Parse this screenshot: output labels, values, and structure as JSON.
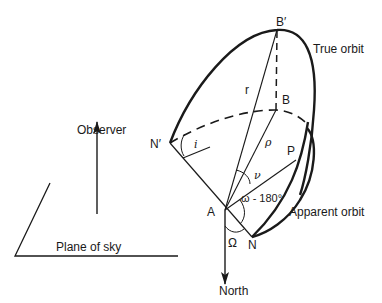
{
  "diagram": {
    "type": "orbital-geometry",
    "labels": {
      "b_prime": "B′",
      "b": "B",
      "true_orbit": "True orbit",
      "r": "r",
      "rho": "ρ",
      "n_prime": "N′",
      "i": "i",
      "p": "P",
      "nu": "ν",
      "omega_minus_180": "ω - 180°",
      "a": "A",
      "apparent_orbit": "Apparent orbit",
      "big_omega": "Ω",
      "n": "N",
      "north": "North",
      "observer": "Observer",
      "plane_of_sky": "Plane of sky"
    },
    "colors": {
      "ink": "#1a1a1a",
      "background": "#ffffff"
    }
  }
}
